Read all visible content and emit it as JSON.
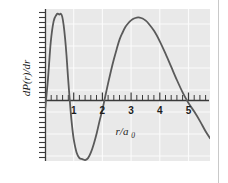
{
  "figure": {
    "background_color": "#ffffff",
    "panel_color": "#e9e9e9",
    "grid_color": "#fbfbfb",
    "curve_color": "#5a5a5a",
    "axis_color": "#3a3a3a",
    "border_rule_color": "#c9c9c9"
  },
  "labels": {
    "ylabel_main": "dP(r)/dr",
    "xlabel_main": "r/a",
    "xlabel_subscript": "0",
    "xlabel_full": "r/a0"
  },
  "chart_data": {
    "type": "line",
    "title": "",
    "subtitle": "",
    "xlabel": "r/a0",
    "ylabel": "dP(r)/dr",
    "xlim": [
      0,
      5.75
    ],
    "ylim": [
      -0.55,
      1.05
    ],
    "grid": true,
    "legend": null,
    "legend_position": "none",
    "xticks_major": [
      1,
      2,
      3,
      4,
      5
    ],
    "xtick_labels": [
      "1",
      "2",
      "3",
      "4",
      "5"
    ],
    "xtick_minor_step": 0.2,
    "yticks_major": [],
    "ytick_labels": [],
    "ytick_minor_step": 0.0667,
    "zero_line": 0,
    "annotations": [],
    "series": [
      {
        "name": "dP(r)/dr",
        "color": "#5a5a5a",
        "x": [
          0.0,
          0.1,
          0.2,
          0.3,
          0.4,
          0.45,
          0.5,
          0.55,
          0.6,
          0.65,
          0.7,
          0.75,
          0.8,
          0.85,
          0.9,
          0.95,
          1.0,
          1.1,
          1.2,
          1.3,
          1.4,
          1.5,
          1.6,
          1.7,
          1.8,
          1.9,
          2.0,
          2.1,
          2.2,
          2.3,
          2.4,
          2.5,
          2.6,
          2.7,
          2.8,
          2.9,
          3.0,
          3.1,
          3.2,
          3.3,
          3.4,
          3.5,
          3.6,
          3.8,
          4.0,
          4.2,
          4.4,
          4.6,
          4.8,
          5.0,
          5.2,
          5.4,
          5.6,
          5.75
        ],
        "y": [
          -0.02,
          0.3,
          0.7,
          0.92,
          0.99,
          1.0,
          0.99,
          1.0,
          0.97,
          0.88,
          0.74,
          0.56,
          0.34,
          0.14,
          -0.05,
          -0.2,
          -0.32,
          -0.46,
          -0.52,
          -0.53,
          -0.54,
          -0.52,
          -0.46,
          -0.37,
          -0.26,
          -0.13,
          -0.01,
          0.13,
          0.27,
          0.4,
          0.52,
          0.63,
          0.73,
          0.8,
          0.86,
          0.9,
          0.93,
          0.95,
          0.96,
          0.96,
          0.95,
          0.93,
          0.9,
          0.82,
          0.71,
          0.58,
          0.44,
          0.3,
          0.17,
          0.06,
          -0.03,
          -0.13,
          -0.24,
          -0.31
        ],
        "peaks": [
          {
            "x": 0.52,
            "y": 1.0,
            "label": "first maximum"
          },
          {
            "x": 3.25,
            "y": 0.96,
            "label": "second maximum"
          }
        ],
        "minima": [
          {
            "x": 1.38,
            "y": -0.54,
            "label": "minimum"
          }
        ],
        "zero_crossings": [
          0.84,
          2.01,
          5.13
        ]
      }
    ]
  }
}
